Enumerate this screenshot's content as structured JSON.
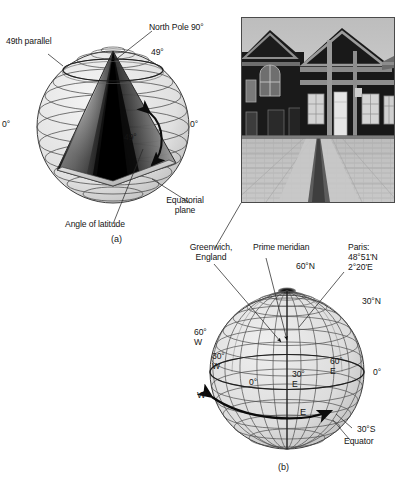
{
  "figure": {
    "top_fragment": "partial text cut off at top edge",
    "panels": [
      {
        "id": "a",
        "caption": "(a)"
      },
      {
        "id": "b",
        "caption": "(b)"
      }
    ]
  },
  "panel_a": {
    "caption": "(a)",
    "labels": {
      "north_pole": "North Pole 90°",
      "parallel_49": "49th parallel",
      "deg_49_top_right": "49°",
      "deg_0_left": "0°",
      "deg_0_right": "0°",
      "angle_arc": "49°",
      "equatorial_plane": "Equatorial\nplane",
      "angle_of_latitude": "Angle of latitude"
    }
  },
  "panel_b": {
    "caption": "(b)",
    "labels": {
      "greenwich": "Greenwich,\nEngland",
      "prime_meridian": "Prime meridian",
      "paris": "Paris:\n48°51'N\n2°20'E",
      "lat_60n": "60°N",
      "lat_30n": "30°N",
      "lat_30s": "30°S",
      "equator": "Equator",
      "lon_60w": "60°\nW",
      "lon_30w": "30°\nW",
      "lon_0_center": "0°",
      "lon_30e": "30°\nE",
      "lon_60e": "60°\nE",
      "lon_0_right": "0°",
      "dir_west": "W",
      "dir_east": "E"
    }
  },
  "photo": {
    "name": "greenwich-prime-meridian-photo",
    "alt": "Royal Observatory Greenwich courtyard with the Prime Meridian line in the pavement"
  },
  "colors": {
    "ink": "#151515",
    "line": "#3a3a3a",
    "sphere_fill": "#e2e2e2",
    "globe_fill": "#dcdcdc",
    "photo_dark": "#141414",
    "photo_mid": "#8d8d8d",
    "photo_light": "#c9c9c9"
  }
}
